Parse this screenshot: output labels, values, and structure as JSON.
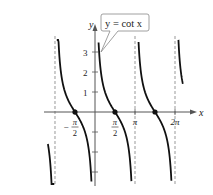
{
  "chart_data": {
    "type": "line",
    "title": "",
    "function_label": "y = cot x",
    "xlabel": "x",
    "ylabel": "y",
    "x_ticks": [
      {
        "value": -1.5708,
        "num": "π",
        "den": "2",
        "sign": "−"
      },
      {
        "value": 1.5708,
        "num": "π",
        "den": "2",
        "sign": ""
      },
      {
        "value": 3.1416,
        "label": "π"
      },
      {
        "value": 6.2832,
        "label": "2π"
      }
    ],
    "y_ticks": [
      {
        "value": 3,
        "label": "3"
      },
      {
        "value": 2,
        "label": "2"
      },
      {
        "value": 1,
        "label": "1"
      },
      {
        "value": -1,
        "label": ""
      },
      {
        "value": -2,
        "label": ""
      },
      {
        "value": -3,
        "label": ""
      }
    ],
    "asymptotes": [
      -3.1416,
      0,
      3.1416,
      6.2832
    ],
    "zeros": [
      -1.5708,
      1.5708,
      4.7124
    ],
    "xlim": [
      -3.7,
      6.9
    ],
    "ylim": [
      -3.6,
      3.6
    ],
    "grid": false,
    "series": [
      {
        "name": "y = cot x",
        "branches": [
          [
            -3.7,
            -3.2
          ],
          [
            -3.0,
            -0.28
          ],
          [
            0.28,
            2.86
          ],
          [
            3.42,
            6.0
          ],
          [
            6.55,
            6.9
          ]
        ]
      }
    ],
    "colors": {
      "curve": "#111111",
      "axis": "#555555",
      "asymptote": "#999999",
      "callout_border": "#888888"
    }
  }
}
